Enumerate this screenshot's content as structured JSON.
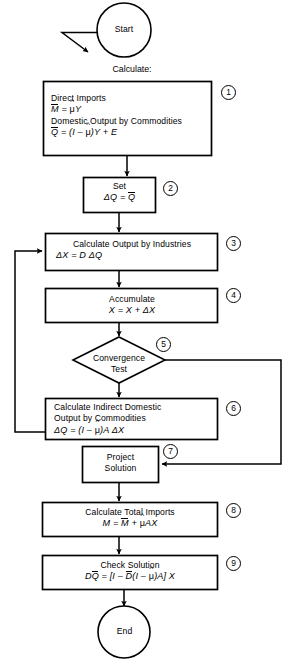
{
  "diagram": {
    "type": "flowchart",
    "background_color": "#ffffff",
    "line_color": "#000000",
    "text_color": "#000000"
  },
  "terminators": {
    "start": "Start",
    "end": "End"
  },
  "caption": {
    "calculate": "Calculate:"
  },
  "steps": [
    {
      "tag": "1",
      "shape": "process",
      "lines": [
        "Direct Imports"
      ],
      "formula_1": "M̄ = μ̂Y",
      "lines_2": [
        "Domestic Output by Commodities"
      ],
      "formula_2": "Q̄ = (I – μ̂)Y + E",
      "text_line_1": "Direct Imports",
      "text_line_2": "Domestic Output by Commodities"
    },
    {
      "tag": "2",
      "shape": "process",
      "text_line_1": "Set",
      "formula_1": "ΔQ = Q̄"
    },
    {
      "tag": "3",
      "shape": "process",
      "text_line_1": "Calculate Output by Industries",
      "formula_1": "ΔX = D ΔQ"
    },
    {
      "tag": "4",
      "shape": "process",
      "text_line_1": "Accumulate",
      "formula_1": "X = X + ΔX"
    },
    {
      "tag": "5",
      "shape": "decision",
      "text_line_1": "Convergence",
      "text_line_2": "Test"
    },
    {
      "tag": "6",
      "shape": "process",
      "text_line_1": "Calculate Indirect Domestic",
      "text_line_2": "Output by Commodities",
      "formula_1": "ΔQ = (I – μ̂)A ΔX"
    },
    {
      "tag": "7",
      "shape": "process",
      "text_line_1": "Project",
      "text_line_2": "Solution"
    },
    {
      "tag": "8",
      "shape": "process",
      "text_line_1": "Calculate Total Imports",
      "formula_1": "M = M̄ + μ̂AX"
    },
    {
      "tag": "9",
      "shape": "process",
      "text_line_1": "Check Solution",
      "formula_1": "DQ̄ = [I – D̄(I – μ̂)A] X"
    }
  ],
  "tags": {
    "t1": "1",
    "t2": "2",
    "t3": "3",
    "t4": "4",
    "t5": "5",
    "t6": "6",
    "t7": "7",
    "t8": "8",
    "t9": "9"
  },
  "connectors": [
    {
      "name": "start-to-box1",
      "from": "start",
      "to": "step-1",
      "style": "arrow-down"
    },
    {
      "name": "box1-to-box2",
      "from": "step-1",
      "to": "step-2",
      "style": "arrow-down"
    },
    {
      "name": "box2-to-box3",
      "from": "step-2",
      "to": "step-3",
      "style": "arrow-down"
    },
    {
      "name": "box3-to-box4",
      "from": "step-3",
      "to": "step-4",
      "style": "arrow-down"
    },
    {
      "name": "box4-to-decision",
      "from": "step-4",
      "to": "step-5",
      "style": "arrow-down"
    },
    {
      "name": "decision-to-box6",
      "from": "step-5",
      "to": "step-6",
      "style": "arrow-down"
    },
    {
      "name": "decision-branch-right",
      "from": "step-5",
      "to": "step-7",
      "style": "right-down-left-arrow"
    },
    {
      "name": "box6-feedback-loop",
      "from": "step-6",
      "to": "step-3",
      "style": "left-up-right-arrow"
    },
    {
      "name": "box7-to-box8",
      "from": "step-7",
      "to": "step-8",
      "style": "arrow-down"
    },
    {
      "name": "box8-to-box9",
      "from": "step-8",
      "to": "step-9",
      "style": "arrow-down"
    },
    {
      "name": "box9-to-end",
      "from": "step-9",
      "to": "end",
      "style": "arrow-down"
    },
    {
      "name": "entry-pointer-arrow",
      "from": "start",
      "to": "",
      "style": "diagonal-arrow"
    }
  ]
}
